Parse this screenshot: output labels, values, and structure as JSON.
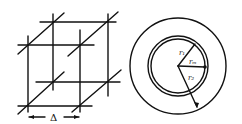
{
  "figure": {
    "left_panel": {
      "name": "cubic-lattice",
      "spacing_label": "Δ"
    },
    "right_panel": {
      "name": "concentric-circles",
      "labels": {
        "inner_radius": "r₁",
        "mid_radius": "rₘ",
        "outer_radius": "r₂"
      }
    }
  },
  "colors": {
    "ink": "#111111",
    "background": "#ffffff"
  }
}
